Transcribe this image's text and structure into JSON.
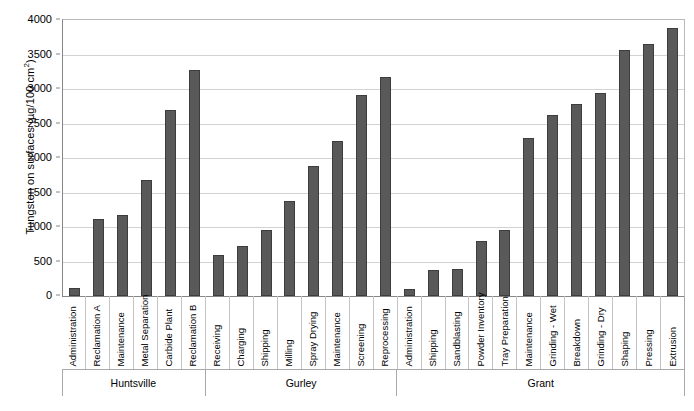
{
  "chart_data": {
    "type": "bar",
    "title": "",
    "xlabel": "",
    "ylabel": "Tungsten on surfaces (µg/100 cm2)",
    "ylabel_main": "Tungsten on surfaces (µg/100 cm",
    "ylabel_exponent": "2",
    "ylabel_close": ")",
    "ylim": [
      0,
      4000
    ],
    "ytick_labels": [
      "4000",
      "3500",
      "3000",
      "2500",
      "2000",
      "1500",
      "1000",
      "500",
      "0"
    ],
    "ytick_values": [
      4000,
      3500,
      3000,
      2500,
      2000,
      1500,
      1000,
      500,
      0
    ],
    "grid": true,
    "legend": "none",
    "bar_color": "#595959",
    "bar_edge_color": "#3d3d3d",
    "categories": [
      "Administration",
      "Reclamation A",
      "Maintenance",
      "Metal Separation",
      "Carbide Plant",
      "Reclamation B",
      "Receiving",
      "Charging",
      "Shipping",
      "Milling",
      "Spray Drying",
      "Maintenance",
      "Screening",
      "Reprocessing",
      "Administration",
      "Shipping",
      "Sandblasting",
      "Powder Inventory",
      "Tray Preparation",
      "Maintenance",
      "Grinding - Wet",
      "Breakdown",
      "Grinding - Dry",
      "Shaping",
      "Pressing",
      "Extrusion"
    ],
    "values": [
      110,
      1120,
      1170,
      1680,
      2700,
      3280,
      600,
      720,
      960,
      1370,
      1890,
      2250,
      2910,
      3170,
      100,
      380,
      390,
      800,
      960,
      2290,
      2630,
      2790,
      2940,
      3570,
      3650,
      3890
    ],
    "groups": [
      {
        "label": "Huntsville",
        "count": 6
      },
      {
        "label": "Gurley",
        "count": 8
      },
      {
        "label": "Grant",
        "count": 12
      }
    ]
  }
}
